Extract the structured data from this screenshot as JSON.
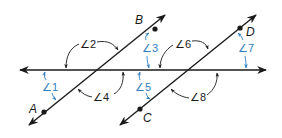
{
  "diagram": {
    "points": {
      "A": "A",
      "B": "B",
      "C": "C",
      "D": "D"
    },
    "angles": {
      "a1": "∠1",
      "a2": "∠2",
      "a3": "∠3",
      "a4": "∠4",
      "a5": "∠5",
      "a6": "∠6",
      "a7": "∠7",
      "a8": "∠8"
    },
    "colors": {
      "line": "#1a1a1a",
      "accent_blue": "#2f7fc0"
    }
  }
}
